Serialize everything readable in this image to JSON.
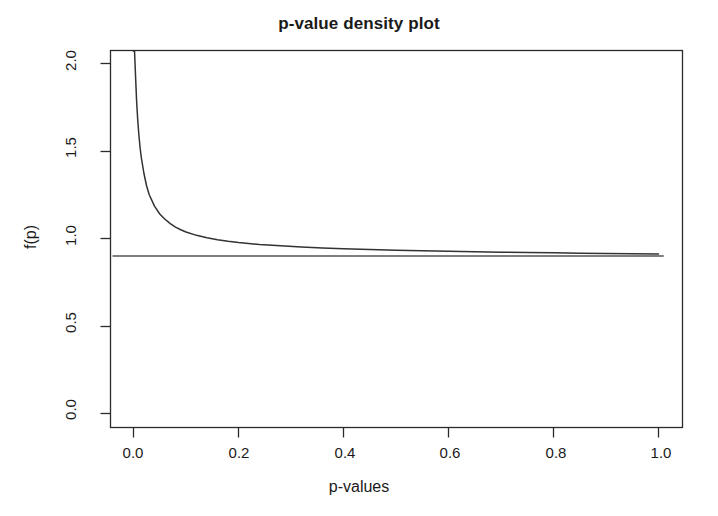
{
  "chart_data": {
    "type": "line",
    "title": "p-value density plot",
    "xlabel": "p-values",
    "ylabel": "f(p)",
    "xlim": [
      -0.04,
      1.04
    ],
    "ylim": [
      -0.02,
      2.12
    ],
    "grid": false,
    "legend": "none",
    "xticks": [
      0.0,
      0.2,
      0.4,
      0.6,
      0.8,
      1.0
    ],
    "xtick_labels": [
      "0.0",
      "0.2",
      "0.4",
      "0.6",
      "0.8",
      "1.0"
    ],
    "yticks": [
      0.0,
      0.5,
      1.0,
      1.5,
      2.0
    ],
    "ytick_labels": [
      "0.0",
      "0.5",
      "1.0",
      "1.5",
      "2.0"
    ],
    "series": [
      {
        "name": "mixture density",
        "type": "line",
        "color": "#333333",
        "x": [
          0.0,
          0.002,
          0.004,
          0.006,
          0.008,
          0.01,
          0.0125,
          0.015,
          0.02,
          0.025,
          0.03,
          0.04,
          0.05,
          0.06,
          0.07,
          0.08,
          0.09,
          0.1,
          0.12,
          0.14,
          0.16,
          0.18,
          0.2,
          0.24,
          0.28,
          0.32,
          0.36,
          0.4,
          0.45,
          0.5,
          0.55,
          0.6,
          0.65,
          0.7,
          0.75,
          0.8,
          0.85,
          0.9,
          0.95,
          1.0
        ],
        "y": [
          2.12,
          2.1,
          1.92,
          1.78,
          1.68,
          1.6,
          1.52,
          1.46,
          1.37,
          1.3,
          1.25,
          1.185,
          1.14,
          1.11,
          1.085,
          1.065,
          1.05,
          1.037,
          1.018,
          1.004,
          0.993,
          0.984,
          0.977,
          0.966,
          0.958,
          0.951,
          0.946,
          0.942,
          0.937,
          0.933,
          0.93,
          0.927,
          0.925,
          0.922,
          0.92,
          0.918,
          0.916,
          0.914,
          0.913,
          0.911
        ]
      },
      {
        "name": "null proportion baseline",
        "type": "hline",
        "color": "#555555",
        "value": 0.9,
        "x_range": [
          -0.04,
          1.01
        ]
      }
    ]
  }
}
